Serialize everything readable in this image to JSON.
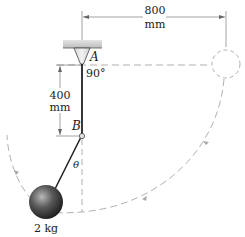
{
  "figure": {
    "type": "pendulum-mechanics-diagram",
    "labels": {
      "point_a": "A",
      "point_b": "B",
      "angle_a": "90°",
      "angle_theta": "θ",
      "mass": "2 kg",
      "horizontal_dim_value": "800",
      "horizontal_dim_unit": "mm",
      "vertical_dim_value": "400",
      "vertical_dim_unit": "mm"
    },
    "colors": {
      "line": "#222222",
      "dashed": "#a8a8a8",
      "ceiling": "#c8c8c8",
      "ball_light": "#9a9a9a",
      "ball_dark": "#1e1e1e"
    }
  }
}
